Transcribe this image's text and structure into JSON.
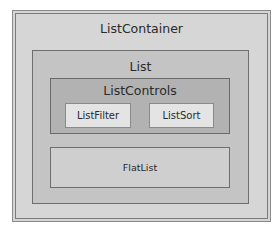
{
  "diagram": {
    "outer": {
      "label": "ListContainer"
    },
    "list": {
      "label": "List"
    },
    "controls": {
      "label": "ListControls"
    },
    "filter": {
      "label": "ListFilter"
    },
    "sort": {
      "label": "ListSort"
    },
    "flat": {
      "label": "FlatList"
    }
  }
}
